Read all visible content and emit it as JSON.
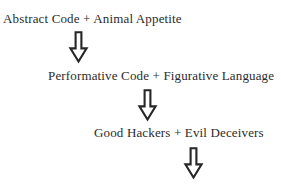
{
  "diagram": {
    "background_color": "#ffffff",
    "text_color": "#2b2b2b",
    "arrow_color": "#262626",
    "arrow_fill": "#ffffff",
    "stages": [
      {
        "label": "Abstract Code + Animal Appetite"
      },
      {
        "label": "Performative Code + Figurative Language"
      },
      {
        "label": "Good Hackers + Evil Deceivers"
      }
    ],
    "arrows": [
      {
        "icon": "arrow-down-outline-icon",
        "glyph": "⇩"
      },
      {
        "icon": "arrow-down-outline-icon",
        "glyph": "⇩"
      },
      {
        "icon": "arrow-down-outline-icon",
        "glyph": "⇩"
      }
    ]
  }
}
